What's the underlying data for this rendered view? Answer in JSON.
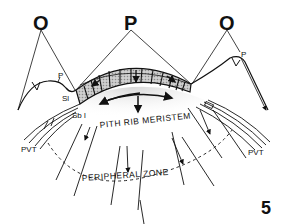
{
  "labels": {
    "o_left": "O",
    "p_center": "P",
    "o_right": "O",
    "p_left": "P",
    "p_right": "P",
    "sl": "Sl",
    "sbl": "Sb l",
    "pvt_left": "PVT",
    "pvt_right": "PVT",
    "pith_rib_meristem": "PITH RIB MERISTEM",
    "peripheral_zone": "PERIPHERAL ZONE",
    "figure_number": "5"
  },
  "colors": {
    "ink": "#111111",
    "stipple": "#bdbdbd",
    "stipple_light": "#e6e6e6",
    "background": "#ffffff"
  }
}
